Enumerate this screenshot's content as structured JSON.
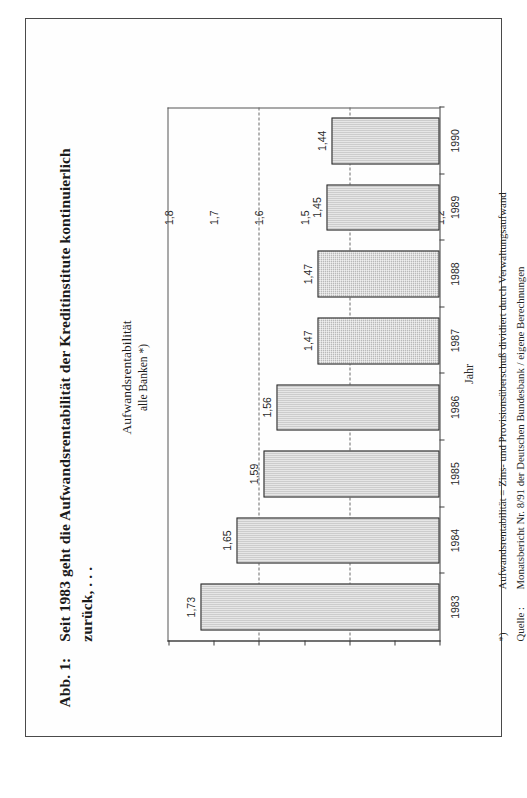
{
  "figure": {
    "number_label": "Abb. 1:",
    "caption_line1": "Seit 1983 geht die Aufwandsrentabilität der Kreditinstitute kontinuierlich",
    "caption_line2": "zurück, . . ."
  },
  "chart_header": {
    "title": "Aufwandsrentabilität",
    "subtitle": "alle Banken *)"
  },
  "footnotes": {
    "note_marker": "*)",
    "note_text": "Aufwandsrentabilität = Zins- und Provisionsüberschuß dividiert durch Verwaltungsaufwand",
    "source_label": "Quelle :",
    "source_text": "Monatsbericht Nr. 8/91 der Deutschen Bundesbank / eigene Berechnungen"
  },
  "chart_data": {
    "type": "bar",
    "title": "Aufwandsrentabilität",
    "subtitle": "alle Banken *)",
    "xlabel": "Jahr",
    "ylabel": "",
    "categories": [
      "1983",
      "1984",
      "1985",
      "1986",
      "1987",
      "1988",
      "1989",
      "1990"
    ],
    "values": [
      1.73,
      1.65,
      1.59,
      1.56,
      1.47,
      1.47,
      1.45,
      1.44
    ],
    "value_labels": [
      "1,73",
      "1,65",
      "1,59",
      "1,56",
      "1,47",
      "1,47",
      "1,45",
      "1,44"
    ],
    "ylim": [
      1.2,
      1.8
    ],
    "yticks": [
      1.2,
      1.3,
      1.4,
      1.5,
      1.6,
      1.7,
      1.8
    ],
    "ytick_labels": [
      "1,2",
      "1,3",
      "1,4",
      "1,5",
      "1,6",
      "1,7",
      "1,8"
    ],
    "gridlines": [
      1.4,
      1.6
    ],
    "grid": "dashed-horizontal",
    "legend": "none",
    "bar_fill_color": "#b9b9b9",
    "bar_border_color": "#2b2b2b",
    "axis_color": "#3a3a3a"
  }
}
